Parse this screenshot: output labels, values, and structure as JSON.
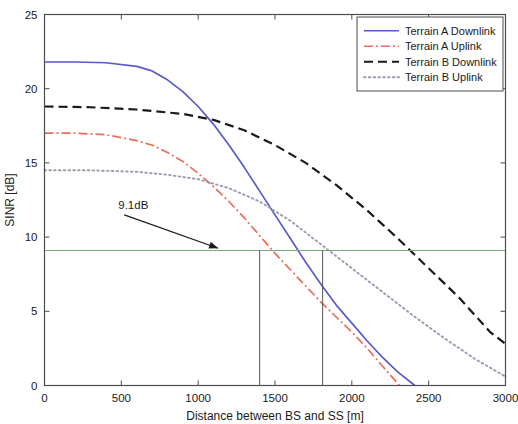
{
  "chart_data": {
    "type": "line",
    "title": "",
    "xlabel": "Distance between BS and SS [m]",
    "ylabel": "SINR [dB]",
    "xlim": [
      0,
      3000
    ],
    "ylim": [
      0,
      25
    ],
    "xticks": [
      0,
      500,
      1000,
      1500,
      2000,
      2500,
      3000
    ],
    "xtick_labels": [
      "0",
      "500",
      "1000",
      "1500",
      "2000",
      "2500",
      "3000"
    ],
    "yticks": [
      0,
      5,
      10,
      15,
      20,
      25
    ],
    "ytick_labels": [
      "0",
      "5",
      "10",
      "15",
      "20",
      "25"
    ],
    "grid": false,
    "legend_position": "top-right",
    "series": [
      {
        "name": "Terrain A Downlink",
        "color": "#5a5ac8",
        "style": "solid",
        "x": [
          0,
          200,
          400,
          600,
          700,
          800,
          900,
          1000,
          1100,
          1200,
          1300,
          1400,
          1500,
          1600,
          1700,
          1800,
          1900,
          2000,
          2100,
          2200,
          2300,
          2410
        ],
        "y": [
          21.8,
          21.8,
          21.75,
          21.5,
          21.2,
          20.6,
          19.8,
          18.8,
          17.6,
          16.2,
          14.7,
          13.1,
          11.5,
          9.9,
          8.3,
          6.8,
          5.4,
          4.2,
          3.0,
          1.9,
          0.9,
          0.0
        ]
      },
      {
        "name": "Terrain A Uplink",
        "color": "#e8705a",
        "style": "dashdot",
        "x": [
          0,
          200,
          400,
          600,
          700,
          800,
          900,
          1000,
          1100,
          1200,
          1300,
          1400,
          1500,
          1600,
          1700,
          1800,
          1900,
          2000,
          2100,
          2200,
          2310
        ],
        "y": [
          17.0,
          17.0,
          16.9,
          16.5,
          16.2,
          15.7,
          15.1,
          14.3,
          13.4,
          12.4,
          11.3,
          10.1,
          8.9,
          7.8,
          6.7,
          5.6,
          4.6,
          3.6,
          2.5,
          1.3,
          0.0
        ]
      },
      {
        "name": "Terrain B Downlink",
        "color": "#1a1a1a",
        "style": "dashed",
        "x": [
          0,
          300,
          600,
          900,
          1100,
          1300,
          1500,
          1700,
          1900,
          2100,
          2300,
          2500,
          2700,
          2900,
          3000
        ],
        "y": [
          18.8,
          18.75,
          18.6,
          18.3,
          17.9,
          17.2,
          16.2,
          15.0,
          13.5,
          11.8,
          9.9,
          7.9,
          5.9,
          3.6,
          2.8
        ]
      },
      {
        "name": "Terrain B Uplink",
        "color": "#9a9ab4",
        "style": "dotted",
        "x": [
          0,
          300,
          600,
          800,
          1000,
          1200,
          1400,
          1600,
          1800,
          2000,
          2200,
          2400,
          2600,
          2800,
          3000
        ],
        "y": [
          14.5,
          14.5,
          14.4,
          14.2,
          13.9,
          13.3,
          12.4,
          11.1,
          9.5,
          7.9,
          6.3,
          4.7,
          3.2,
          1.8,
          0.6
        ]
      }
    ],
    "reference_lines": [
      {
        "name": "sinr-threshold",
        "orientation": "horizontal",
        "value": 9.1,
        "label": "9.1dB",
        "color": "#7aa87a"
      },
      {
        "name": "range-marker-a",
        "orientation": "vertical",
        "value": 1400,
        "color": "#555555"
      },
      {
        "name": "range-marker-b",
        "orientation": "vertical",
        "value": 1810,
        "color": "#555555"
      }
    ],
    "annotations": [
      {
        "text": "9.1dB",
        "x": 480,
        "y": 11.9,
        "arrow_to_x": 1130,
        "arrow_to_y": 9.25
      }
    ]
  }
}
